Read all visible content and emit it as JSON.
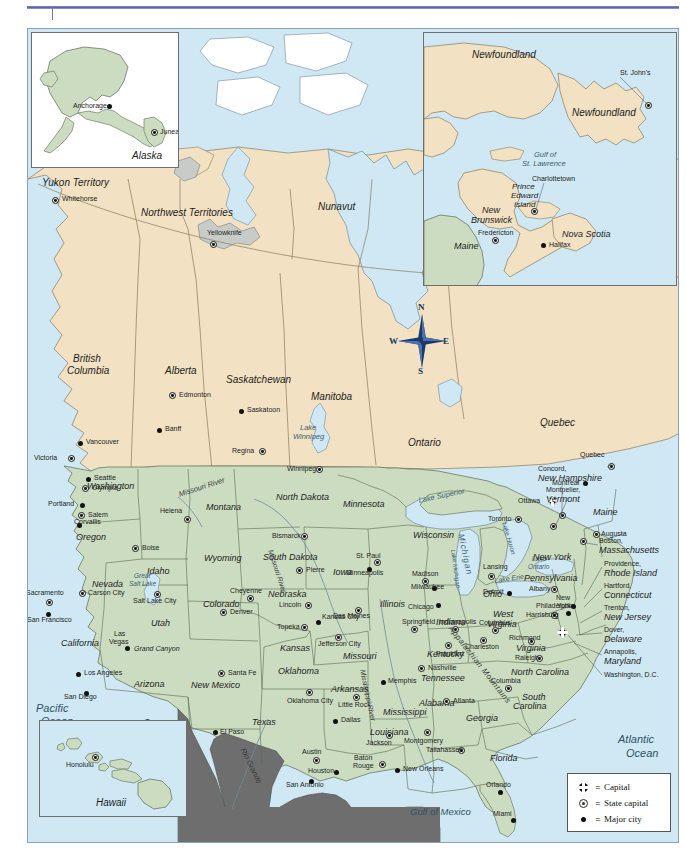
{
  "document": {
    "title": "Map of the United States and Canada",
    "top_rule": true
  },
  "map": {
    "colors": {
      "ocean": "#CFE8F3",
      "canada_land": "#F2E1C3",
      "usa_land": "#CBDCC0",
      "mexico_land": "#6E6E6E",
      "lake_ice": "#C8CCC8",
      "border": "#8A7B5E",
      "frame": "#8AA3B4",
      "accent_rule": "#5A6AA8"
    },
    "legend": {
      "title": "",
      "items": [
        {
          "symbol": "capital-icon",
          "equals": "=",
          "label": "Capital"
        },
        {
          "symbol": "state-capital-icon",
          "equals": "=",
          "label": "State capital"
        },
        {
          "symbol": "major-city-icon",
          "equals": "=",
          "label": "Major city"
        }
      ]
    },
    "compass": {
      "north": "N",
      "south": "S",
      "east": "E",
      "west": "W"
    },
    "insets": [
      {
        "id": "alaska",
        "title": "Alaska"
      },
      {
        "id": "canada-east",
        "title": ""
      },
      {
        "id": "hawaii",
        "title": "Hawaii"
      }
    ],
    "oceans": [
      {
        "name": "Pacific Ocean",
        "line1": "Pacific",
        "line2": "Ocean"
      },
      {
        "name": "Atlantic Ocean",
        "line1": "Atlantic",
        "line2": "Ocean"
      },
      {
        "name": "Gulf of Mexico",
        "line1": "Gulf of Mexico",
        "line2": ""
      }
    ],
    "water_features": [
      {
        "label": "Lake Superior"
      },
      {
        "label": "Lake Michigan"
      },
      {
        "label": "Lake Huron"
      },
      {
        "label": "Lake Erie"
      },
      {
        "label": "Lake Ontario"
      },
      {
        "label": "Lake Winnipeg"
      },
      {
        "label": "Great Salt Lake"
      },
      {
        "label": "Gulf of St. Lawrence"
      },
      {
        "label": "Missouri River"
      },
      {
        "label": "Mississippi River"
      },
      {
        "label": "Rio Grande"
      },
      {
        "label": "Appalachian Mountains"
      },
      {
        "label": "Grand Canyon"
      }
    ],
    "canada_regions": [
      {
        "name": "Yukon Territory"
      },
      {
        "name": "Northwest Territories"
      },
      {
        "name": "Nunavut"
      },
      {
        "name": "British Columbia",
        "line1": "British",
        "line2": "Columbia"
      },
      {
        "name": "Alberta"
      },
      {
        "name": "Saskatchewan"
      },
      {
        "name": "Manitoba"
      },
      {
        "name": "Ontario"
      },
      {
        "name": "Quebec"
      },
      {
        "name": "Newfoundland"
      },
      {
        "name": "New Brunswick",
        "line1": "New",
        "line2": "Brunswick"
      },
      {
        "name": "Prince Edward Island",
        "line1": "Prince",
        "line2": "Edward",
        "line3": "Island"
      },
      {
        "name": "Nova Scotia"
      }
    ],
    "canada_cities": [
      {
        "name": "Whitehorse",
        "type": "state-capital"
      },
      {
        "name": "Yellowknife",
        "type": "state-capital"
      },
      {
        "name": "Edmonton",
        "type": "state-capital"
      },
      {
        "name": "Banff",
        "type": "major"
      },
      {
        "name": "Saskatoon",
        "type": "major"
      },
      {
        "name": "Regina",
        "type": "state-capital"
      },
      {
        "name": "Winnipeg",
        "type": "state-capital"
      },
      {
        "name": "Vancouver",
        "type": "major"
      },
      {
        "name": "Victoria",
        "type": "state-capital"
      },
      {
        "name": "Toronto",
        "type": "state-capital"
      },
      {
        "name": "Ottawa",
        "type": "capital"
      },
      {
        "name": "Montreal",
        "type": "major"
      },
      {
        "name": "Quebec",
        "type": "state-capital"
      },
      {
        "name": "St. John's",
        "type": "state-capital"
      },
      {
        "name": "Charlottetown",
        "type": "state-capital"
      },
      {
        "name": "Fredericton",
        "type": "state-capital"
      },
      {
        "name": "Halifax",
        "type": "major"
      },
      {
        "name": "Anchorage",
        "type": "major"
      },
      {
        "name": "Juneau",
        "type": "state-capital"
      },
      {
        "name": "Honolulu",
        "type": "state-capital"
      }
    ],
    "us_states": [
      "Washington",
      "Oregon",
      "Idaho",
      "Montana",
      "North Dakota",
      "Minnesota",
      "Wisconsin",
      "Michigan",
      "Wyoming",
      "South Dakota",
      "Iowa",
      "Illinois",
      "Indiana",
      "Ohio",
      "Nevada",
      "Utah",
      "Colorado",
      "Nebraska",
      "Kansas",
      "Missouri",
      "Kentucky",
      "California",
      "Arizona",
      "New Mexico",
      "Oklahoma",
      "Arkansas",
      "Tennessee",
      "North Carolina",
      "South Carolina",
      "Texas",
      "Louisiana",
      "Mississippi",
      "Alabama",
      "Georgia",
      "Florida",
      "Virginia",
      "West Virginia",
      "Pennsylvania",
      "New York",
      "Maine",
      "Vermont",
      "New Hampshire",
      "Massachusetts",
      "Rhode Island",
      "Connecticut",
      "New Jersey",
      "Delaware",
      "Maryland",
      "Hawaii",
      "Alaska"
    ],
    "us_cities": [
      {
        "name": "Seattle",
        "type": "major"
      },
      {
        "name": "Olympia",
        "type": "state-capital"
      },
      {
        "name": "Portland",
        "type": "major"
      },
      {
        "name": "Salem",
        "type": "state-capital"
      },
      {
        "name": "Corvallis",
        "type": "major"
      },
      {
        "name": "Boise",
        "type": "state-capital"
      },
      {
        "name": "Helena",
        "type": "state-capital"
      },
      {
        "name": "Bismarck",
        "type": "state-capital"
      },
      {
        "name": "Pierre",
        "type": "state-capital"
      },
      {
        "name": "St. Paul",
        "type": "state-capital"
      },
      {
        "name": "Minneapolis",
        "type": "major"
      },
      {
        "name": "Madison",
        "type": "state-capital"
      },
      {
        "name": "Milwaukee",
        "type": "major"
      },
      {
        "name": "Lansing",
        "type": "state-capital"
      },
      {
        "name": "Detroit",
        "type": "major"
      },
      {
        "name": "Chicago",
        "type": "major"
      },
      {
        "name": "Des Moines",
        "type": "state-capital"
      },
      {
        "name": "Springfield",
        "type": "state-capital"
      },
      {
        "name": "Indianapolis",
        "type": "state-capital"
      },
      {
        "name": "Columbus",
        "type": "state-capital"
      },
      {
        "name": "Cheyenne",
        "type": "state-capital"
      },
      {
        "name": "Lincoln",
        "type": "state-capital"
      },
      {
        "name": "Denver",
        "type": "state-capital"
      },
      {
        "name": "Salt Lake City",
        "type": "state-capital"
      },
      {
        "name": "Carson City",
        "type": "state-capital"
      },
      {
        "name": "Sacramento",
        "type": "state-capital"
      },
      {
        "name": "San Francisco",
        "type": "major"
      },
      {
        "name": "Las Vegas",
        "type": "major"
      },
      {
        "name": "Los Angeles",
        "type": "major"
      },
      {
        "name": "San Diego",
        "type": "major"
      },
      {
        "name": "Phoenix",
        "type": "state-capital"
      },
      {
        "name": "Santa Fe",
        "type": "state-capital"
      },
      {
        "name": "Topeka",
        "type": "state-capital"
      },
      {
        "name": "Kansas City",
        "type": "major"
      },
      {
        "name": "Jefferson City",
        "type": "state-capital"
      },
      {
        "name": "Oklahoma City",
        "type": "state-capital"
      },
      {
        "name": "Little Rock",
        "type": "state-capital"
      },
      {
        "name": "Memphis",
        "type": "major"
      },
      {
        "name": "Nashville",
        "type": "state-capital"
      },
      {
        "name": "Frankfort",
        "type": "state-capital"
      },
      {
        "name": "Charleston",
        "type": "state-capital"
      },
      {
        "name": "Richmond",
        "type": "state-capital"
      },
      {
        "name": "Raleigh",
        "type": "state-capital"
      },
      {
        "name": "Columbia",
        "type": "state-capital"
      },
      {
        "name": "Atlanta",
        "type": "state-capital"
      },
      {
        "name": "Montgomery",
        "type": "state-capital"
      },
      {
        "name": "Jackson",
        "type": "state-capital"
      },
      {
        "name": "Baton Rouge",
        "type": "state-capital"
      },
      {
        "name": "New Orleans",
        "type": "major"
      },
      {
        "name": "Tallahassee",
        "type": "state-capital"
      },
      {
        "name": "Orlando",
        "type": "major"
      },
      {
        "name": "Miami",
        "type": "major"
      },
      {
        "name": "Dallas",
        "type": "major"
      },
      {
        "name": "Austin",
        "type": "state-capital"
      },
      {
        "name": "Houston",
        "type": "major"
      },
      {
        "name": "San Antonio",
        "type": "major"
      },
      {
        "name": "El Paso",
        "type": "major"
      },
      {
        "name": "Albany",
        "type": "state-capital"
      },
      {
        "name": "New York",
        "type": "major"
      },
      {
        "name": "Harrisburg",
        "type": "state-capital"
      },
      {
        "name": "Philadelphia",
        "type": "major"
      },
      {
        "name": "Boston",
        "type": "state-capital"
      },
      {
        "name": "Augusta",
        "type": "state-capital"
      },
      {
        "name": "Washington, D.C.",
        "type": "capital"
      }
    ],
    "northeast_callouts": [
      {
        "city": "Concord,",
        "state": "New Hampshire"
      },
      {
        "city": "Montpelier,",
        "state": "Vermont"
      },
      {
        "city": "Boston,",
        "state": "Massachusetts"
      },
      {
        "city": "Providence,",
        "state": "Rhode Island"
      },
      {
        "city": "Hartford,",
        "state": "Connecticut"
      },
      {
        "city": "Trenton,",
        "state": "New Jersey"
      },
      {
        "city": "Dover,",
        "state": "Delaware"
      },
      {
        "city": "Annapolis,",
        "state": "Maryland"
      },
      {
        "city": "Washington, D.C.",
        "state": ""
      }
    ]
  },
  "labels": {
    "alaska": "Alaska",
    "hawaii": "Hawaii",
    "anchorage": "Anchorage",
    "juneau": "Juneau",
    "honolulu": "Honolulu",
    "yukon": "Yukon Territory",
    "whitehorse": "Whitehorse",
    "nwt": "Northwest Territories",
    "yellowknife": "Yellowknife",
    "nunavut": "Nunavut",
    "bc1": "British",
    "bc2": "Columbia",
    "alberta": "Alberta",
    "saskatchewan": "Saskatchewan",
    "manitoba": "Manitoba",
    "ontario": "Ontario",
    "quebec_prov": "Quebec",
    "edmonton": "Edmonton",
    "banff": "Banff",
    "saskatoon": "Saskatoon",
    "regina": "Regina",
    "winnipeg": "Winnipeg",
    "lake_winnipeg1": "Lake",
    "lake_winnipeg2": "Winnipeg",
    "vancouver": "Vancouver",
    "victoria": "Victoria",
    "newfoundland_lab": "Newfoundland",
    "newfoundland_isl": "Newfoundland",
    "stjohns": "St. John's",
    "gulf_stl1": "Gulf of",
    "gulf_stl2": "St. Lawrence",
    "charlottetown": "Charlottetown",
    "pei1": "Prince",
    "pei2": "Edward",
    "pei3": "Island",
    "nb1": "New",
    "nb2": "Brunswick",
    "fredericton": "Fredericton",
    "nova_scotia": "Nova Scotia",
    "halifax": "Halifax",
    "maine_inset": "Maine",
    "toronto": "Toronto",
    "ottawa": "Ottawa",
    "montreal": "Montreal",
    "quebec_city": "Quebec",
    "lake_superior": "Lake Superior",
    "lake_michigan": "Michigan",
    "lake_michigan2": "Lake Michigan",
    "lake_huron": "Lake Huron",
    "lake_erie": "Lake Erie",
    "lake_ontario1": "Lake",
    "lake_ontario2": "Ontario",
    "pacific1": "Pacific",
    "pacific2": "Ocean",
    "atlantic1": "Atlantic",
    "atlantic2": "Ocean",
    "gulf_mexico": "Gulf of Mexico",
    "missouri_river": "Missouri River",
    "mississippi_river": "Mississippi River",
    "rio_grande": "Rio Grande",
    "appalachian": "Appalachian Mountains",
    "grand_canyon": "Grand Canyon",
    "great_salt1": "Great",
    "great_salt2": "Salt Lake",
    "seattle": "Seattle",
    "olympia": "Olympia",
    "washington_st": "Washington",
    "portland": "Portland",
    "salem": "Salem",
    "corvallis": "Corvallis",
    "oregon": "Oregon",
    "boise": "Boise",
    "idaho": "Idaho",
    "helena": "Helena",
    "montana": "Montana",
    "north_dakota": "North Dakota",
    "bismarck": "Bismarck",
    "minnesota": "Minnesota",
    "st_paul": "St. Paul",
    "minneapolis": "Minneapolis",
    "wisconsin": "Wisconsin",
    "madison": "Madison",
    "milwaukee": "Milwaukee",
    "lansing": "Lansing",
    "detroit": "Detroit",
    "chicago": "Chicago",
    "illinois": "Illinois",
    "springfield": "Springfield",
    "indiana": "Indiana",
    "indianapolis": "Indianapolis",
    "ohio": "Ohio",
    "columbus": "Columbus",
    "south_dakota": "South Dakota",
    "pierre": "Pierre",
    "wyoming": "Wyoming",
    "cheyenne": "Cheyenne",
    "nebraska": "Nebraska",
    "lincoln": "Lincoln",
    "iowa": "Iowa",
    "des_moines": "Des Moines",
    "nevada": "Nevada",
    "carson_city": "Carson City",
    "sacramento": "Sacramento",
    "san_francisco": "San Francisco",
    "california": "California",
    "las_vegas1": "Las",
    "las_vegas2": "Vegas",
    "los_angeles": "Los Angeles",
    "san_diego": "San Diego",
    "utah": "Utah",
    "salt_lake_city": "Salt Lake City",
    "colorado": "Colorado",
    "denver": "Denver",
    "arizona": "Arizona",
    "phoenix": "Phoenix",
    "new_mexico": "New Mexico",
    "santa_fe": "Santa Fe",
    "el_paso": "El Paso",
    "kansas": "Kansas",
    "topeka": "Topeka",
    "kansas_city": "Kansas City",
    "missouri": "Missouri",
    "jefferson_city": "Jefferson City",
    "oklahoma": "Oklahoma",
    "oklahoma_city": "Oklahoma City",
    "arkansas": "Arkansas",
    "little_rock": "Little Rock",
    "texas": "Texas",
    "dallas": "Dallas",
    "austin": "Austin",
    "houston": "Houston",
    "san_antonio": "San Antonio",
    "louisiana": "Louisiana",
    "baton1": "Baton",
    "baton2": "Rouge",
    "new_orleans": "New Orleans",
    "mississippi_st": "Mississippi",
    "jackson": "Jackson",
    "alabama": "Alabama",
    "montgomery": "Montgomery",
    "georgia": "Georgia",
    "atlanta": "Atlanta",
    "florida": "Florida",
    "tallahassee": "Tallahassee",
    "orlando": "Orlando",
    "miami": "Miami",
    "tennessee": "Tennessee",
    "nashville": "Nashville",
    "memphis": "Memphis",
    "kentucky": "Kentucky",
    "frankfort": "Frankfort",
    "charleston": "Charleston",
    "west1": "West",
    "west2": "Virginia",
    "virginia": "Virginia",
    "richmond": "Richmond",
    "north_carolina": "North Carolina",
    "raleigh": "Raleigh",
    "south1": "South",
    "south2": "Carolina",
    "columbia_sc": "Columbia",
    "pennsylvania": "Pennsylvania",
    "harrisburg": "Harrisburg",
    "philadelphia": "Philadelphia",
    "new_york_st": "New York",
    "albany": "Albany",
    "new_york_c1": "New",
    "new_york_c2": "York",
    "maine": "Maine",
    "augusta": "Augusta"
  }
}
